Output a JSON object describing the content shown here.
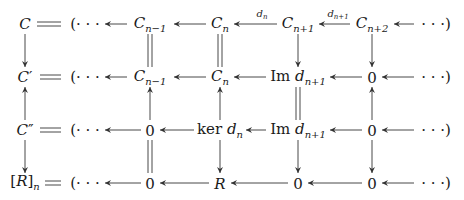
{
  "diagram": {
    "type": "commutative-diagram",
    "rows": [
      {
        "left": {
          "base": "C",
          "sup": "",
          "sub": ""
        },
        "nodes": [
          {
            "pre": "",
            "base": "C",
            "sub": "n−1"
          },
          {
            "pre": "",
            "base": "C",
            "sub": "n"
          },
          {
            "pre": "",
            "base": "C",
            "sub": "n+1"
          },
          {
            "pre": "",
            "base": "C",
            "sub": "n+2"
          }
        ]
      },
      {
        "left": {
          "base": "C",
          "sup": "′",
          "sub": ""
        },
        "nodes": [
          {
            "pre": "",
            "base": "C",
            "sub": "n−1"
          },
          {
            "pre": "",
            "base": "C",
            "sub": "n"
          },
          {
            "pre": "Im ",
            "base": "d",
            "sub": "n+1"
          },
          {
            "pre": "",
            "base": "0",
            "sub": "",
            "upright": true
          }
        ]
      },
      {
        "left": {
          "base": "C",
          "sup": "″",
          "sub": ""
        },
        "nodes": [
          {
            "pre": "",
            "base": "0",
            "sub": "",
            "upright": true
          },
          {
            "pre": "ker ",
            "base": "d",
            "sub": "n"
          },
          {
            "pre": "Im ",
            "base": "d",
            "sub": "n+1"
          },
          {
            "pre": "",
            "base": "0",
            "sub": "",
            "upright": true
          }
        ]
      },
      {
        "left": {
          "base": "[R]",
          "sup": "",
          "sub": "n",
          "bracket": true
        },
        "nodes": [
          {
            "pre": "",
            "base": "0",
            "sub": "",
            "upright": true
          },
          {
            "pre": "",
            "base": "R",
            "sub": ""
          },
          {
            "pre": "",
            "base": "0",
            "sub": "",
            "upright": true
          },
          {
            "pre": "",
            "base": "0",
            "sub": "",
            "upright": true
          }
        ]
      }
    ],
    "open_paren": "(· · ·",
    "close_paren": "· · ·)",
    "arrow_labels": [
      {
        "row": 0,
        "between": [
          1,
          2
        ],
        "base": "d",
        "sub": "n"
      },
      {
        "row": 0,
        "between": [
          2,
          3
        ],
        "base": "d",
        "sub": "n+1"
      }
    ],
    "vertical_arrows": [
      {
        "col": "left",
        "rows": [
          0,
          1
        ],
        "kind": "down"
      },
      {
        "col": "left",
        "rows": [
          1,
          2
        ],
        "kind": "up"
      },
      {
        "col": "left",
        "rows": [
          2,
          3
        ],
        "kind": "down"
      },
      {
        "col": 0,
        "rows": [
          0,
          1
        ],
        "kind": "equal"
      },
      {
        "col": 0,
        "rows": [
          1,
          2
        ],
        "kind": "up"
      },
      {
        "col": 0,
        "rows": [
          2,
          3
        ],
        "kind": "equal"
      },
      {
        "col": 1,
        "rows": [
          0,
          1
        ],
        "kind": "equal"
      },
      {
        "col": 1,
        "rows": [
          1,
          2
        ],
        "kind": "up"
      },
      {
        "col": 1,
        "rows": [
          2,
          3
        ],
        "kind": "down"
      },
      {
        "col": 2,
        "rows": [
          0,
          1
        ],
        "kind": "down"
      },
      {
        "col": 2,
        "rows": [
          1,
          2
        ],
        "kind": "equal"
      },
      {
        "col": 2,
        "rows": [
          2,
          3
        ],
        "kind": "down"
      },
      {
        "col": 3,
        "rows": [
          0,
          1
        ],
        "kind": "down"
      },
      {
        "col": 3,
        "rows": [
          1,
          2
        ],
        "kind": "up"
      },
      {
        "col": 3,
        "rows": [
          2,
          3
        ],
        "kind": "down"
      }
    ]
  }
}
